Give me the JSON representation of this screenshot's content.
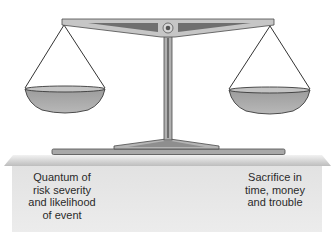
{
  "diagram": {
    "type": "balance-scale",
    "left_pan": {
      "label": "Quantum of\nrisk severity\nand likelihood\nof event"
    },
    "right_pan": {
      "label": "Sacrifice in\ntime, money\nand trouble"
    }
  },
  "colors": {
    "metal": "#a9a9a9",
    "metal_dark": "#7a7a7a",
    "metal_light": "#d0d0d0",
    "outline": "#3a3a3a",
    "platform_top": "#c4c4c4",
    "platform_front": "#e6e6e6",
    "text": "#2a2a2a"
  }
}
